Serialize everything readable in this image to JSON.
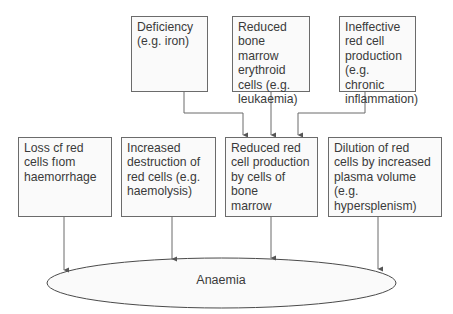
{
  "diagram": {
    "top_row": [
      {
        "id": "deficiency",
        "label": "Deficiency\n(e.g. iron)"
      },
      {
        "id": "reduced-erythroid",
        "label": "Reduced\nbone marrow\nerythroid\ncells (e.g.\nleukaemia)"
      },
      {
        "id": "ineffective-production",
        "label": "Ineffective\nred cell\nproduction\n(e.g. chronic\ninflammation)"
      }
    ],
    "middle_row": [
      {
        "id": "loss-haemorrhage",
        "label": "Loss cf red\ncells fıom\nhaemorrhage"
      },
      {
        "id": "increased-destruction",
        "label": "Increased\ndestruction of\nred cells (e.g.\nhaemolysis)"
      },
      {
        "id": "reduced-production",
        "label": "Reduced red\ncell production\nby cells of bone\nmarrow"
      },
      {
        "id": "dilution",
        "label": "Dilution of red\ncells by increased\nplasma volume\n(e.g. hypersplenism)"
      }
    ],
    "outcome": {
      "id": "anaemia",
      "label": "Anaemia"
    },
    "edges": [
      {
        "from": "deficiency",
        "to": "reduced-production"
      },
      {
        "from": "reduced-erythroid",
        "to": "reduced-production"
      },
      {
        "from": "ineffective-production",
        "to": "reduced-production"
      },
      {
        "from": "loss-haemorrhage",
        "to": "anaemia"
      },
      {
        "from": "increased-destruction",
        "to": "anaemia"
      },
      {
        "from": "reduced-production",
        "to": "anaemia"
      },
      {
        "from": "dilution",
        "to": "anaemia"
      }
    ],
    "colors": {
      "line": "#6b6b6b",
      "box_fill": "#fafafa",
      "text": "#3a3a3a"
    }
  }
}
